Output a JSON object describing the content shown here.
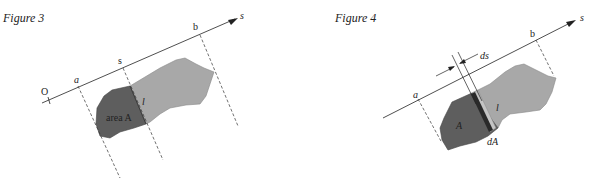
{
  "figures": [
    {
      "title": "Figure 3",
      "axis_label": "s",
      "origin_label": "O",
      "points": {
        "a": "a",
        "s": "s",
        "b": "b"
      },
      "section_label": "l",
      "area_label": "area A",
      "colors": {
        "dark_region": "#5e5e5e",
        "light_region": "#a8a8a8"
      }
    },
    {
      "title": "Figure 4",
      "axis_label": "s",
      "points": {
        "a": "a",
        "b": "b"
      },
      "width_label": "ds",
      "section_label": "l",
      "area_label": "A",
      "strip_label": "dA",
      "colors": {
        "dark_region": "#5e5e5e",
        "light_region": "#a8a8a8",
        "strip": "#2a2a2a",
        "strip_light": "#c4c4c4"
      }
    }
  ]
}
